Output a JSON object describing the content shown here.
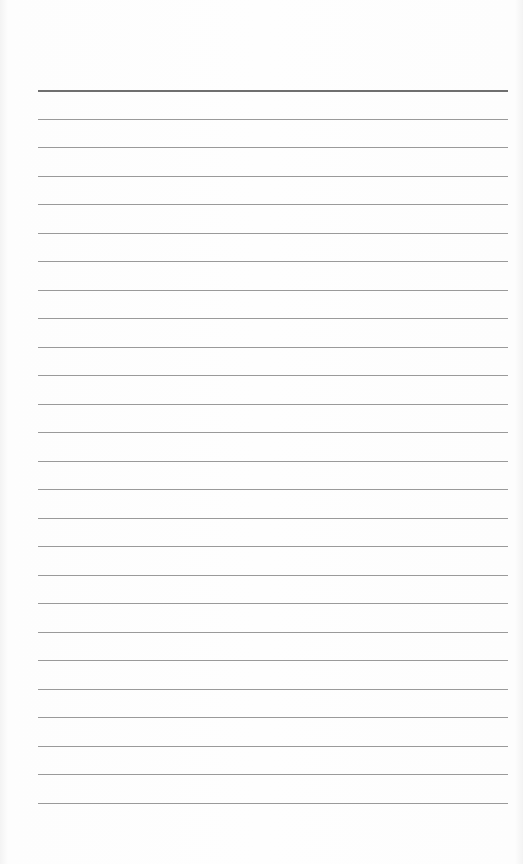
{
  "document": {
    "type": "ruled-paper",
    "background_color": "#fdfdfd",
    "line_color": "#9a9a9a",
    "top_line_color": "#6f6f6f",
    "line_count": 26,
    "first_line_y": 90,
    "line_spacing": 28.5,
    "line_left": 38,
    "line_width": 470
  }
}
